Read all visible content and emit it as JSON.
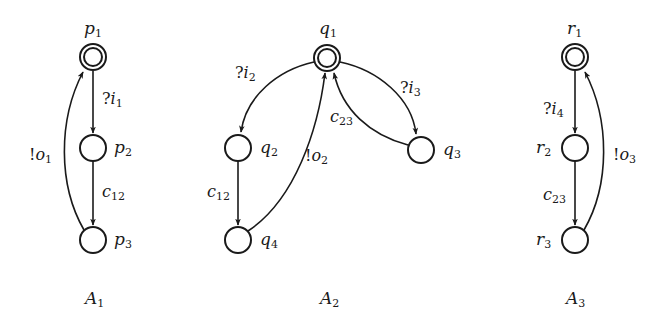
{
  "colors": {
    "ink": "#1a1a1a",
    "background": "#ffffff"
  },
  "automata": [
    {
      "id": "A1",
      "caption": {
        "base": "A",
        "sub": "1"
      },
      "states": [
        {
          "id": "p1",
          "base": "p",
          "sub": "1",
          "initial": true,
          "x": 93,
          "y": 57,
          "label_pos": "top"
        },
        {
          "id": "p2",
          "base": "p",
          "sub": "2",
          "initial": false,
          "x": 93,
          "y": 148,
          "label_pos": "right"
        },
        {
          "id": "p3",
          "base": "p",
          "sub": "3",
          "initial": false,
          "x": 93,
          "y": 240,
          "label_pos": "right"
        }
      ],
      "transitions": [
        {
          "from": "p1",
          "to": "p2",
          "prefix": "?",
          "base": "i",
          "sub": "1"
        },
        {
          "from": "p2",
          "to": "p3",
          "prefix": "",
          "base": "c",
          "sub": "12"
        },
        {
          "from": "p3",
          "to": "p1",
          "prefix": "!",
          "base": "o",
          "sub": "1"
        }
      ]
    },
    {
      "id": "A2",
      "caption": {
        "base": "A",
        "sub": "2"
      },
      "states": [
        {
          "id": "q1",
          "base": "q",
          "sub": "1",
          "initial": true,
          "x": 327,
          "y": 58,
          "label_pos": "top"
        },
        {
          "id": "q2",
          "base": "q",
          "sub": "2",
          "initial": false,
          "x": 238,
          "y": 148,
          "label_pos": "right"
        },
        {
          "id": "q3",
          "base": "q",
          "sub": "3",
          "initial": false,
          "x": 421,
          "y": 150,
          "label_pos": "right"
        },
        {
          "id": "q4",
          "base": "q",
          "sub": "4",
          "initial": false,
          "x": 238,
          "y": 240,
          "label_pos": "right"
        }
      ],
      "transitions": [
        {
          "from": "q1",
          "to": "q2",
          "prefix": "?",
          "base": "i",
          "sub": "2"
        },
        {
          "from": "q1",
          "to": "q3",
          "prefix": "?",
          "base": "i",
          "sub": "3"
        },
        {
          "from": "q3",
          "to": "q1",
          "prefix": "",
          "base": "c",
          "sub": "23"
        },
        {
          "from": "q2",
          "to": "q4",
          "prefix": "",
          "base": "c",
          "sub": "12"
        },
        {
          "from": "q4",
          "to": "q1",
          "prefix": "!",
          "base": "o",
          "sub": "2"
        }
      ]
    },
    {
      "id": "A3",
      "caption": {
        "base": "A",
        "sub": "3"
      },
      "states": [
        {
          "id": "r1",
          "base": "r",
          "sub": "1",
          "initial": true,
          "x": 575,
          "y": 57,
          "label_pos": "top"
        },
        {
          "id": "r2",
          "base": "r",
          "sub": "2",
          "initial": false,
          "x": 575,
          "y": 148,
          "label_pos": "left"
        },
        {
          "id": "r3",
          "base": "r",
          "sub": "3",
          "initial": false,
          "x": 575,
          "y": 240,
          "label_pos": "left"
        }
      ],
      "transitions": [
        {
          "from": "r1",
          "to": "r2",
          "prefix": "?",
          "base": "i",
          "sub": "4"
        },
        {
          "from": "r2",
          "to": "r3",
          "prefix": "",
          "base": "c",
          "sub": "23"
        },
        {
          "from": "r3",
          "to": "r1",
          "prefix": "!",
          "base": "o",
          "sub": "3"
        }
      ]
    }
  ]
}
